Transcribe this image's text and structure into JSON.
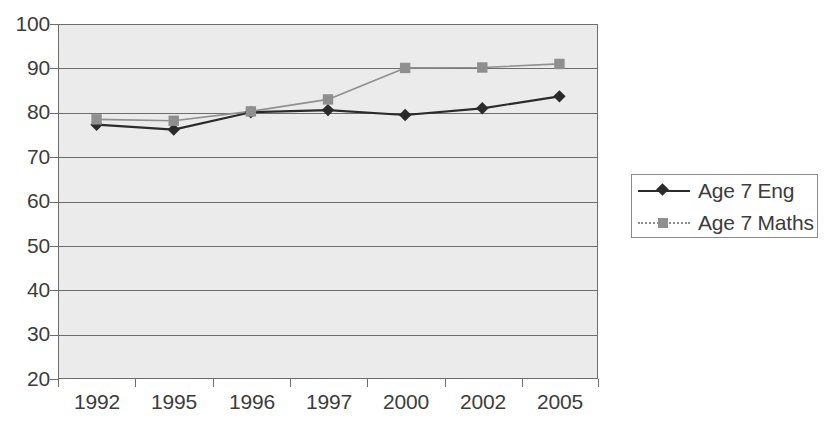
{
  "chart_data": {
    "type": "line",
    "title": "",
    "subtitle": "",
    "xlabel": "",
    "ylabel": "",
    "categories": [
      "1992",
      "1995",
      "1996",
      "1997",
      "2000",
      "2002",
      "2005"
    ],
    "series": [
      {
        "name": "Age 7 Eng",
        "color": "#2b2b2b",
        "marker": "diamond",
        "line_style": "solid",
        "values": [
          77.3,
          76.2,
          80.1,
          80.6,
          79.5,
          81.0,
          83.7
        ]
      },
      {
        "name": "Age 7 Maths",
        "color": "#8f8f8f",
        "marker": "square",
        "line_style": "solid",
        "values": [
          78.5,
          78.2,
          80.3,
          83.0,
          90.1,
          90.2,
          91.0
        ]
      }
    ],
    "ylim": [
      20,
      100
    ],
    "ytick_step": 10,
    "yticks": [
      "100",
      "90",
      "80",
      "70",
      "60",
      "50",
      "40",
      "30",
      "20"
    ],
    "grid": "horizontal",
    "legend_position": "right",
    "plot_background": "#ebebeb",
    "gridline_color": "#6d6d6d"
  },
  "legend": {
    "entries": [
      {
        "label": "Age 7 Eng"
      },
      {
        "label": "Age 7 Maths"
      }
    ]
  }
}
